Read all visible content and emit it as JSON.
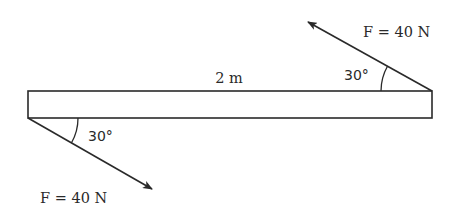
{
  "diagram": {
    "type": "free-body force diagram",
    "beam": {
      "length_label": "2 m",
      "x": 28,
      "y": 91,
      "width": 404,
      "height": 27,
      "stroke": "#2a2a2a"
    },
    "forces": [
      {
        "id": "top-right",
        "label": "F = 40 N",
        "angle_label": "30°",
        "angle_deg": 30,
        "origin": "top-right corner of beam",
        "direction": "up-left"
      },
      {
        "id": "bottom-left",
        "label": "F = 40 N",
        "angle_label": "30°",
        "angle_deg": 30,
        "origin": "bottom-left corner of beam",
        "direction": "down-right"
      }
    ],
    "line_color": "#2a2a2a"
  }
}
